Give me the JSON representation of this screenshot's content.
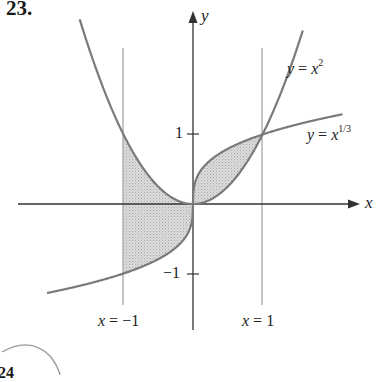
{
  "problem": {
    "number": "23.",
    "next_number_partial": "24"
  },
  "axes": {
    "x_label": "x",
    "y_label": "y",
    "tick_pos_y": "1",
    "tick_neg_y": "−1"
  },
  "curves": {
    "parabola": {
      "label_lhs": "y",
      "label_eq": " = ",
      "label_base": "x",
      "label_exp": "2"
    },
    "cube_root": {
      "label_lhs": "y",
      "label_eq": " = ",
      "label_base": "x",
      "label_exp": "1/3"
    }
  },
  "vertical_lines": {
    "left": {
      "label_var": "x",
      "label_rest": " = −1"
    },
    "right": {
      "label_var": "x",
      "label_rest": " = 1"
    }
  },
  "colors": {
    "curve": "#7a7a7a",
    "axis": "#333333",
    "shade": "#d0d0d0",
    "guide": "#8c8c8c"
  },
  "chart_data": {
    "type": "diagram",
    "title": "23.",
    "functions": [
      "y = x^2",
      "y = x^(1/3)"
    ],
    "shaded_region": "between y = x^2 and y = x^(1/3) for x in [-1, 1]",
    "vertical_guides": [
      -1,
      1
    ],
    "y_ticks": [
      1,
      -1
    ],
    "intersections": [
      [
        0,
        0
      ],
      [
        1,
        1
      ]
    ],
    "x_range": [
      -2.1,
      2.2
    ],
    "y_range": [
      -1.4,
      2.4
    ]
  }
}
